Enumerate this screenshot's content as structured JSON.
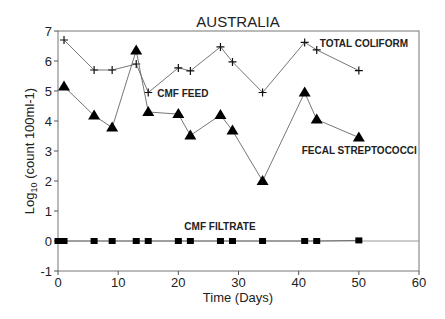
{
  "chart_data": {
    "type": "line",
    "title": "AUSTRALIA",
    "xlabel": "Time (Days)",
    "ylabel": "Log10 (count 100ml-1)",
    "xlim": [
      0,
      60
    ],
    "ylim": [
      -1,
      7
    ],
    "xticks": [
      0,
      10,
      20,
      30,
      40,
      50,
      60
    ],
    "yticks": [
      -1,
      0,
      1,
      2,
      3,
      4,
      5,
      6,
      7
    ],
    "grid": false,
    "annotations": [
      {
        "text": "TOTAL COLIFORM",
        "x": 43.5,
        "y": 6.6
      },
      {
        "text": "CMF FEED",
        "x": 16.5,
        "y": 4.95
      },
      {
        "text": "FECAL STREPTOCOCCI",
        "x": 40.5,
        "y": 3.05
      },
      {
        "text": "CMF FILTRATE",
        "x": 21,
        "y": 0.5
      }
    ],
    "series": [
      {
        "name": "TOTAL COLIFORM",
        "marker": "plus",
        "x": [
          1,
          6,
          9,
          13,
          15,
          20,
          22,
          27,
          29,
          34,
          41,
          43,
          50
        ],
        "y": [
          6.7,
          5.7,
          5.7,
          5.9,
          4.95,
          5.77,
          5.67,
          6.47,
          5.97,
          4.95,
          6.62,
          6.37,
          5.68
        ]
      },
      {
        "name": "FECAL STREPTOCOCCI",
        "marker": "triangle",
        "x": [
          1,
          6,
          9,
          13,
          15,
          20,
          22,
          27,
          29,
          34,
          41,
          43,
          50
        ],
        "y": [
          5.15,
          4.18,
          3.78,
          6.35,
          4.3,
          4.23,
          3.52,
          4.2,
          3.68,
          2.0,
          4.95,
          4.05,
          3.45
        ]
      },
      {
        "name": "CMF FILTRATE",
        "marker": "square",
        "x": [
          0,
          0.5,
          1,
          6,
          9,
          13,
          15,
          20,
          22,
          27,
          29,
          34,
          41,
          43,
          50
        ],
        "y": [
          0,
          0,
          0,
          0,
          0,
          0,
          0,
          0,
          0,
          0,
          0,
          0,
          0,
          0,
          0.02
        ]
      }
    ]
  }
}
